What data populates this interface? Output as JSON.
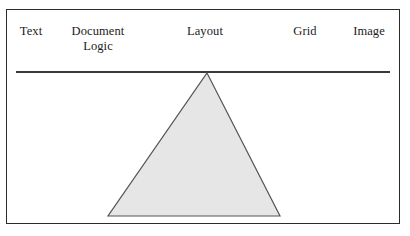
{
  "figure": {
    "background_color": "#ffffff",
    "frame": {
      "border_color": "#2b2b2b",
      "fill_color": "#ffffff"
    },
    "rule": {
      "color": "#3a3a3a",
      "label": "horizontal-rule"
    },
    "labels": [
      {
        "id": "text",
        "text": "Text"
      },
      {
        "id": "document",
        "text": "Document\nLogic"
      },
      {
        "id": "layout",
        "text": "Layout"
      },
      {
        "id": "grid",
        "text": "Grid"
      },
      {
        "id": "image",
        "text": "Image"
      }
    ],
    "triangle": {
      "name": "gray-triangle",
      "fill_color": "#e6e6e6",
      "stroke_color": "#555555",
      "apex_x": 207,
      "apex_y": 73,
      "base_left_x": 108,
      "base_right_x": 280,
      "base_y": 216
    }
  }
}
